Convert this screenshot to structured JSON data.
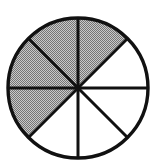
{
  "figure": {
    "name": "fraction-circle-diagram",
    "shape": "circle",
    "sector_count": 8,
    "shaded_count": 5,
    "unshaded_count": 3,
    "fraction_shaded": "5/8",
    "geometry": {
      "center_x": 78,
      "center_y": 88,
      "radius": 70,
      "sector_angle_degrees": 45,
      "divider_count": 4,
      "divider_angles_degrees": [
        0,
        45,
        90,
        135
      ]
    },
    "colors": {
      "outline": "#111111",
      "divider": "#111111",
      "shaded_fill": "#b4b4b4",
      "shaded_dither_dark": "#6e6e6e",
      "unshaded_fill": "#ffffff",
      "background": "#ffffff"
    },
    "stroke": {
      "outline_width": 3.4,
      "divider_width": 3.0
    },
    "sectors": [
      {
        "index": 1,
        "start_angle_deg": 0,
        "end_angle_deg": 45,
        "clock_span": "12:00-1:30",
        "shaded": true
      },
      {
        "index": 2,
        "start_angle_deg": 45,
        "end_angle_deg": 90,
        "clock_span": "1:30-3:00",
        "shaded": false
      },
      {
        "index": 3,
        "start_angle_deg": 90,
        "end_angle_deg": 135,
        "clock_span": "3:00-4:30",
        "shaded": false
      },
      {
        "index": 4,
        "start_angle_deg": 135,
        "end_angle_deg": 180,
        "clock_span": "4:30-6:00",
        "shaded": false
      },
      {
        "index": 5,
        "start_angle_deg": 180,
        "end_angle_deg": 225,
        "clock_span": "6:00-7:30",
        "shaded": false
      },
      {
        "index": 6,
        "start_angle_deg": 225,
        "end_angle_deg": 270,
        "clock_span": "7:30-9:00",
        "shaded": true
      },
      {
        "index": 7,
        "start_angle_deg": 270,
        "end_angle_deg": 315,
        "clock_span": "9:00-10:30",
        "shaded": true
      },
      {
        "index": 8,
        "start_angle_deg": 315,
        "end_angle_deg": 360,
        "clock_span": "10:30-12:00",
        "shaded": true
      }
    ]
  },
  "chart_data": {
    "type": "pie",
    "xlabel": "",
    "ylabel": "",
    "categories": [
      "Shaded",
      "Unshaded"
    ],
    "values": [
      5,
      3
    ],
    "slice_count": 8,
    "slice_value_each": 1,
    "slice_fraction_each": 0.125,
    "slices": [
      {
        "label": "Sector 1",
        "value": 1,
        "shaded": true
      },
      {
        "label": "Sector 2",
        "value": 1,
        "shaded": false
      },
      {
        "label": "Sector 3",
        "value": 1,
        "shaded": false
      },
      {
        "label": "Sector 4",
        "value": 1,
        "shaded": false
      },
      {
        "label": "Sector 5",
        "value": 1,
        "shaded": false
      },
      {
        "label": "Sector 6",
        "value": 1,
        "shaded": true
      },
      {
        "label": "Sector 7",
        "value": 1,
        "shaded": true
      },
      {
        "label": "Sector 8",
        "value": 1,
        "shaded": true
      }
    ],
    "legend_position": "none",
    "grid": false,
    "annotations": []
  }
}
